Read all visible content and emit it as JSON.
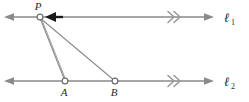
{
  "figure": {
    "colors": {
      "line": "#8a8a8a",
      "ray": "#8a8a8a",
      "marker_stroke": "#6e6e6e",
      "marker_fill": "#ffffff",
      "arrow_highlight": "#1a1a1a",
      "text": "#2b2b2b",
      "background": "#ffffff"
    },
    "lines": [
      {
        "id": "line-1",
        "label": "ℓ",
        "subscript": "1",
        "y": 17,
        "x_start": 5,
        "x_end": 213,
        "left_arrow": true,
        "right_arrow": true,
        "tick_mark": "double-chevron",
        "tick_x": 173,
        "label_x": 224,
        "label_y": 22
      },
      {
        "id": "line-2",
        "label": "ℓ",
        "subscript": "2",
        "y": 81,
        "x_start": 5,
        "x_end": 213,
        "left_arrow": true,
        "right_arrow": true,
        "tick_mark": "double-chevron",
        "tick_x": 173,
        "label_x": 224,
        "label_y": 86
      }
    ],
    "points": [
      {
        "id": "point-p",
        "label": "P",
        "x": 40,
        "y": 17,
        "label_x": 38,
        "label_y": 9,
        "on_line": "line-1",
        "marker": "open-circle"
      },
      {
        "id": "point-a",
        "label": "A",
        "x": 65,
        "y": 81,
        "label_x": 62,
        "label_y": 95,
        "on_line": "line-2",
        "marker": "open-circle"
      },
      {
        "id": "point-b",
        "label": "B",
        "x": 115,
        "y": 81,
        "label_x": 112,
        "label_y": 95,
        "on_line": "line-2",
        "marker": "open-circle"
      }
    ],
    "segments": [
      {
        "id": "segment-p-a",
        "from": "P",
        "to": "A",
        "x1": 40,
        "y1": 18,
        "x2": 65,
        "y2": 81
      },
      {
        "id": "segment-p-b",
        "from": "P",
        "to": "B",
        "x1": 40,
        "y1": 18,
        "x2": 115,
        "y2": 81
      },
      {
        "id": "segment-p-a-inner",
        "from": "P",
        "to": "A",
        "x1": 41,
        "y1": 19,
        "x2": 66,
        "y2": 83
      }
    ],
    "highlight_arrow": {
      "id": "arrow-to-p",
      "description": "bold arrowhead pointing left toward P along line 1",
      "x_tip": 46,
      "x_tail": 62,
      "y": 17
    }
  }
}
